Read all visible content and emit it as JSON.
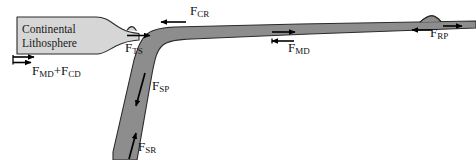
{
  "figure": {
    "background_color": "#ffffff",
    "continental_fill": "#d6d6d6",
    "oceanic_fill": "#8d8d8d",
    "outline_color": "#2b2b2b",
    "arrow_color": "#000000"
  },
  "blocks": {
    "continental": {
      "line1": "Continental",
      "line2": "Lithosphere"
    }
  },
  "forces": [
    {
      "id": "fmd-cd",
      "name": "basal-drag-continental",
      "base": "F",
      "sub1": "MD",
      "plus": "+",
      "base2": "F",
      "sub2": "CD",
      "full": "F_MD + F_CD",
      "direction": "right-and-right"
    },
    {
      "id": "fts",
      "name": "trench-suction",
      "base": "F",
      "sub1": "TS",
      "full": "F_TS",
      "direction": "right"
    },
    {
      "id": "fcr",
      "name": "colliding-resistance",
      "base": "F",
      "sub1": "CR",
      "full": "F_CR",
      "direction": "left"
    },
    {
      "id": "fsp",
      "name": "slab-pull",
      "base": "F",
      "sub1": "SP",
      "full": "F_SP",
      "direction": "down-slab"
    },
    {
      "id": "fsr",
      "name": "slab-resistance",
      "base": "F",
      "sub1": "SR",
      "full": "F_SR",
      "direction": "up-slab"
    },
    {
      "id": "fmd",
      "name": "mantle-drag-oceanic",
      "base": "F",
      "sub1": "MD",
      "full": "F_MD",
      "direction": "right-and-left"
    },
    {
      "id": "frp",
      "name": "ridge-push",
      "base": "F",
      "sub1": "RP",
      "full": "F_RP",
      "direction": "left-and-right"
    }
  ]
}
